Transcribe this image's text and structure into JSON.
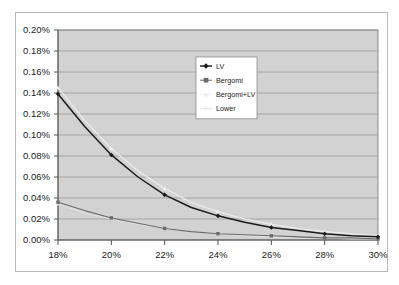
{
  "chart_data": {
    "type": "line",
    "title": "",
    "subtitle": "",
    "xlabel": "",
    "ylabel": "",
    "xlim": [
      18,
      30
    ],
    "ylim": [
      0.0,
      0.002
    ],
    "xticks": [
      18,
      20,
      22,
      24,
      26,
      28,
      30
    ],
    "xtick_labels": [
      "18%",
      "20%",
      "22%",
      "24%",
      "26%",
      "28%",
      "30%"
    ],
    "yticks": [
      0.0,
      0.0002,
      0.0004,
      0.0006,
      0.0008,
      0.001,
      0.0012,
      0.0014,
      0.0016,
      0.0018,
      0.002
    ],
    "ytick_labels": [
      "0.00%",
      "0.02%",
      "0.04%",
      "0.06%",
      "0.08%",
      "0.10%",
      "0.12%",
      "0.14%",
      "0.16%",
      "0.18%",
      "0.20%"
    ],
    "grid": true,
    "grid_axis": "y",
    "legend_position": "upper-right-inside",
    "plot_bg": "#d2d2d2",
    "grid_color": "#9a9a9a",
    "axis_color": "#6e6e6e",
    "x": [
      18,
      19,
      20,
      21,
      22,
      23,
      24,
      25,
      26,
      27,
      28,
      29,
      30
    ],
    "series": [
      {
        "name": "LV",
        "color": "#1a1a1a",
        "marker": "diamond",
        "marker_color": "#1a1a1a",
        "values": [
          0.00139,
          0.00108,
          0.00081,
          0.0006,
          0.00043,
          0.00031,
          0.00023,
          0.00017,
          0.00012,
          9e-05,
          6e-05,
          4e-05,
          3e-05
        ]
      },
      {
        "name": "Bergomi",
        "color": "#6b6b6b",
        "marker": "square",
        "marker_color": "#6b6b6b",
        "values": [
          0.00036,
          0.00028,
          0.00021,
          0.00016,
          0.00011,
          8e-05,
          6e-05,
          5e-05,
          4e-05,
          3e-05,
          2e-05,
          2e-05,
          1e-05
        ]
      },
      {
        "name": "Bergomi+LV",
        "color": "#efefef",
        "marker": "triangle",
        "marker_color": "#efefef",
        "values": [
          0.00145,
          0.00114,
          0.00087,
          0.00066,
          0.00049,
          0.00036,
          0.00027,
          0.0002,
          0.00015,
          0.00011,
          8e-05,
          6e-05,
          4e-05
        ]
      },
      {
        "name": "Lower",
        "color": "#e2e2e2",
        "marker": "cross",
        "marker_color": "#e2e2e2",
        "values": [
          0.00034,
          0.00026,
          0.0002,
          0.00015,
          0.00011,
          8e-05,
          6e-05,
          4e-05,
          3e-05,
          2e-05,
          2e-05,
          1e-05,
          1e-05
        ]
      }
    ],
    "legend": [
      {
        "label": "LV",
        "color": "#1a1a1a",
        "marker": "diamond"
      },
      {
        "label": "Bergomi",
        "color": "#6b6b6b",
        "marker": "square"
      },
      {
        "label": "Bergomi+LV",
        "color": "#efefef",
        "marker": "triangle"
      },
      {
        "label": "Lower",
        "color": "#e2e2e2",
        "marker": "cross"
      }
    ]
  }
}
